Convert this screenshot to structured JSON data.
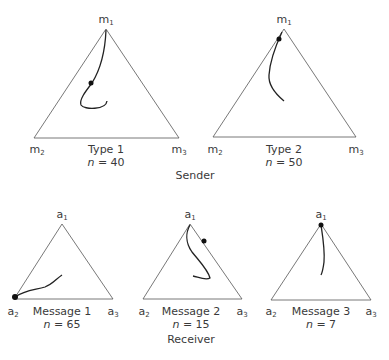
{
  "sender": {
    "group_label": "Sender",
    "panels": [
      {
        "title": "Type 1",
        "n_label": "n",
        "n_value": "40",
        "vertices": {
          "top": [
            "m",
            "1"
          ],
          "left": [
            "m",
            "2"
          ],
          "right": [
            "m",
            "3"
          ]
        }
      },
      {
        "title": "Type 2",
        "n_label": "n",
        "n_value": "50",
        "vertices": {
          "top": [
            "m",
            "1"
          ],
          "left": [
            "m",
            "2"
          ],
          "right": [
            "m",
            "3"
          ]
        }
      }
    ]
  },
  "receiver": {
    "group_label": "Receiver",
    "panels": [
      {
        "title": "Message 1",
        "n_label": "n",
        "n_value": "65",
        "vertices": {
          "top": [
            "a",
            "1"
          ],
          "left": [
            "a",
            "2"
          ],
          "right": [
            "a",
            "3"
          ]
        }
      },
      {
        "title": "Message 2",
        "n_label": "n",
        "n_value": "15",
        "vertices": {
          "top": [
            "a",
            "1"
          ],
          "left": [
            "a",
            "2"
          ],
          "right": [
            "a",
            "3"
          ]
        }
      },
      {
        "title": "Message 3",
        "n_label": "n",
        "n_value": "7",
        "vertices": {
          "top": [
            "a",
            "1"
          ],
          "left": [
            "a",
            "2"
          ],
          "right": [
            "a",
            "3"
          ]
        }
      }
    ]
  },
  "colors": {
    "line": "#333333",
    "text": "#3a3a3a"
  }
}
